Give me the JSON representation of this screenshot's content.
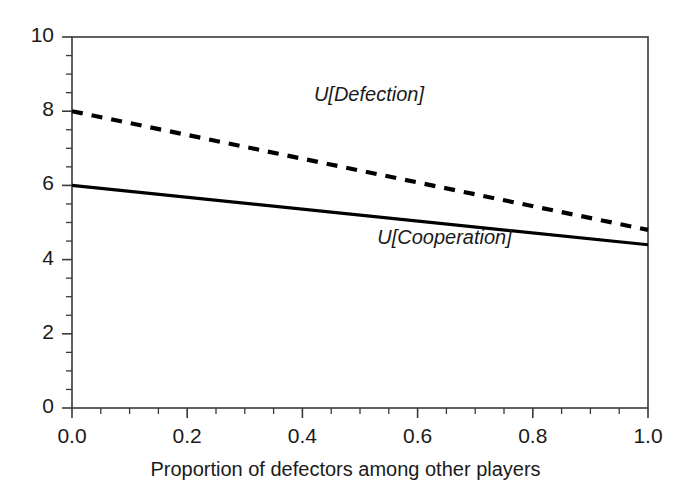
{
  "chart_data": {
    "type": "line",
    "title": "",
    "subtitle": "",
    "xlabel": "Proportion of defectors among other players",
    "ylabel": "",
    "xlim": [
      0.0,
      1.0
    ],
    "ylim": [
      0,
      10
    ],
    "grid": false,
    "legend_position": "inline-annotations",
    "x": [
      0.0,
      1.0
    ],
    "xticks": [
      0.0,
      0.2,
      0.4,
      0.6,
      0.8,
      1.0
    ],
    "xtick_labels": [
      "0.0",
      "0.2",
      "0.4",
      "0.6",
      "0.8",
      "1.0"
    ],
    "x_minor_tick_step": 0.05,
    "yticks": [
      0,
      2,
      4,
      6,
      8,
      10
    ],
    "ytick_labels": [
      "0",
      "2",
      "4",
      "6",
      "8",
      "10"
    ],
    "y_minor_tick_step": 0.5,
    "series": [
      {
        "name": "U[Defection]",
        "label": "U[Defection]",
        "style": "dashed",
        "color": "#000000",
        "values": [
          8.0,
          4.8
        ]
      },
      {
        "name": "U[Cooperation]",
        "label": "U[Cooperation]",
        "style": "solid",
        "color": "#000000",
        "values": [
          6.0,
          4.4
        ]
      }
    ],
    "annotations": [
      {
        "text": "U[Defection]",
        "x": 0.42,
        "y": 8.4
      },
      {
        "text": "U[Cooperation]",
        "x": 0.53,
        "y": 4.55
      }
    ]
  },
  "colors": {
    "frame": "#3a3a3a",
    "ink": "#1a1a1a",
    "background": "#ffffff"
  }
}
